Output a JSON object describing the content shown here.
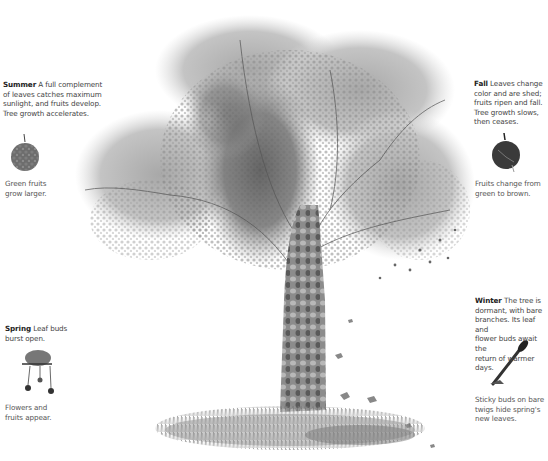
{
  "figure": {
    "seasons": [
      {
        "id": "summer",
        "heading": "Summer",
        "text": "A full complement of leaves catches maximum sunlight, and fruits develop. Tree growth accelerates.",
        "lines": [
          "A full complement",
          "of leaves catches maximum",
          "sunlight, and fruits develop.",
          "Tree growth accelerates."
        ],
        "icon": "green-fruit-icon",
        "note_lines": [
          "Green fruits",
          "grow larger."
        ]
      },
      {
        "id": "fall",
        "heading": "Fall",
        "text": "Leaves change color and are shed; fruits ripen and fall. Tree growth slows, then ceases.",
        "lines": [
          "Leaves change",
          "color and are shed;",
          "fruits ripen and fall.",
          "Tree growth slows,",
          "then ceases."
        ],
        "icon": "brown-fruit-icon",
        "note_lines": [
          "Fruits change from",
          "green to brown."
        ]
      },
      {
        "id": "spring",
        "heading": "Spring",
        "text": "Leaf buds burst open.",
        "lines": [
          "Leaf buds",
          "burst open."
        ],
        "icon": "flower-cluster-icon",
        "note_lines": [
          "Flowers and",
          "fruits appear."
        ]
      },
      {
        "id": "winter",
        "heading": "Winter",
        "text": "The tree is dormant, with bare branches. Its leaf and flower buds await the return of warmer days.",
        "lines": [
          "The tree is",
          "dormant, with bare",
          "branches. Its leaf and",
          "flower buds await the",
          "return of warmer days."
        ],
        "icon": "sticky-bud-icon",
        "note_lines": [
          "Sticky buds on bare",
          "twigs hide spring's",
          "new leaves."
        ]
      }
    ]
  }
}
